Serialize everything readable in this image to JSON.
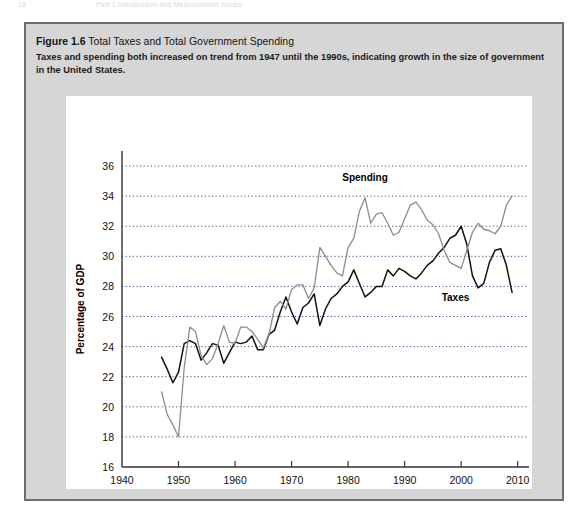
{
  "page": {
    "folio": "18",
    "running_head": "Part 1 Introduction and Measurement Issues"
  },
  "figure": {
    "number_label": "Figure 1.6",
    "title": "Total Taxes and Total Government Spending",
    "caption": "Taxes and spending both increased on trend from 1947 until the 1990s, indicating growth in the size of government in the United States."
  },
  "colors": {
    "box_background": "#d6d6d6",
    "box_border": "#6e6e6e",
    "plot_background": "#ffffff",
    "taxes_line": "#111111",
    "spending_line": "#8c8c8c",
    "gridline": "#4a4a8a",
    "axis": "#333333"
  },
  "chart_data": {
    "type": "line",
    "title": "Total Taxes and Total Government Spending",
    "xlabel": "Year",
    "ylabel": "Percentage of GDP",
    "xlim": [
      1940,
      2012
    ],
    "ylim": [
      16,
      37
    ],
    "xticks": [
      1940,
      1950,
      1960,
      1970,
      1980,
      1990,
      2000,
      2010
    ],
    "yticks": [
      16,
      18,
      20,
      22,
      24,
      26,
      28,
      30,
      32,
      34,
      36
    ],
    "grid": "horizontal-dotted",
    "legend": "inline-annotations",
    "annotations": [
      {
        "text": "Spending",
        "x": 1983,
        "y": 35.0
      },
      {
        "text": "Taxes",
        "x": 1999,
        "y": 27.0
      }
    ],
    "x": [
      1947,
      1948,
      1949,
      1950,
      1951,
      1952,
      1953,
      1954,
      1955,
      1956,
      1957,
      1958,
      1959,
      1960,
      1961,
      1962,
      1963,
      1964,
      1965,
      1966,
      1967,
      1968,
      1969,
      1970,
      1971,
      1972,
      1973,
      1974,
      1975,
      1976,
      1977,
      1978,
      1979,
      1980,
      1981,
      1982,
      1983,
      1984,
      1985,
      1986,
      1987,
      1988,
      1989,
      1990,
      1991,
      1992,
      1993,
      1994,
      1995,
      1996,
      1997,
      1998,
      1999,
      2000,
      2001,
      2002,
      2003,
      2004,
      2005,
      2006,
      2007,
      2008,
      2009
    ],
    "series": [
      {
        "name": "Taxes",
        "color": "#111111",
        "values": [
          23.3,
          22.5,
          21.6,
          22.3,
          24.2,
          24.4,
          24.2,
          23.1,
          23.6,
          24.2,
          24.1,
          22.9,
          23.6,
          24.3,
          24.2,
          24.3,
          24.7,
          23.8,
          23.8,
          24.8,
          25.1,
          26.3,
          27.3,
          26.3,
          25.5,
          26.6,
          26.9,
          27.5,
          25.4,
          26.5,
          27.2,
          27.5,
          28.0,
          28.3,
          29.1,
          28.2,
          27.3,
          27.6,
          28.0,
          28.0,
          29.1,
          28.7,
          29.2,
          29.0,
          28.7,
          28.5,
          28.9,
          29.4,
          29.7,
          30.2,
          30.6,
          31.2,
          31.4,
          32.0,
          30.8,
          28.7,
          27.9,
          28.2,
          29.6,
          30.4,
          30.5,
          29.4,
          27.6
        ]
      },
      {
        "name": "Spending",
        "color": "#8c8c8c",
        "values": [
          21.0,
          19.5,
          18.8,
          18.0,
          22.6,
          25.3,
          25.0,
          23.4,
          22.8,
          23.2,
          24.2,
          25.4,
          24.3,
          24.2,
          25.3,
          25.3,
          25.0,
          24.5,
          23.9,
          24.8,
          26.6,
          27.0,
          26.5,
          27.8,
          28.1,
          28.1,
          27.2,
          27.9,
          30.6,
          30.0,
          29.4,
          28.9,
          28.7,
          30.6,
          31.2,
          33.0,
          33.9,
          32.2,
          32.8,
          32.9,
          32.2,
          31.4,
          31.6,
          32.5,
          33.4,
          33.6,
          33.1,
          32.4,
          32.1,
          31.5,
          30.4,
          29.6,
          29.4,
          29.2,
          30.4,
          31.6,
          32.2,
          31.8,
          31.7,
          31.5,
          32.0,
          33.4,
          34.0
        ]
      }
    ]
  }
}
